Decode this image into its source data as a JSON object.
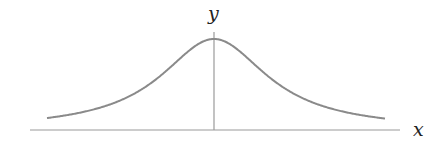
{
  "chart_data": {
    "type": "line",
    "title": "",
    "xlabel": "x",
    "ylabel": "y",
    "grid": false,
    "legend": null,
    "x_range": [
      -2.6,
      2.6
    ],
    "series": [
      {
        "name": "curve",
        "color": "#8a8a8a",
        "x": [
          -2.57,
          -2.0,
          -1.5,
          -1.0,
          -0.5,
          0,
          0.5,
          1.0,
          1.5,
          2.0,
          2.57
        ],
        "y": [
          0.13,
          0.2,
          0.31,
          0.5,
          0.8,
          1.0,
          0.8,
          0.5,
          0.31,
          0.2,
          0.13
        ]
      }
    ]
  },
  "axes": {
    "x_label": "x",
    "y_label": "y",
    "axis_color": "#9a9a9a"
  }
}
